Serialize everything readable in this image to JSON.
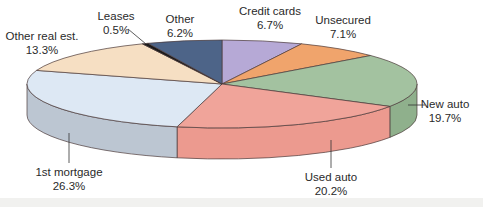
{
  "chart_data": {
    "type": "pie",
    "style": "3d-exploded-none",
    "title": "",
    "start_angle_deg": -90,
    "direction": "clockwise",
    "slices": [
      {
        "label": "Credit cards",
        "value": 6.7,
        "value_label": "6.7%",
        "color": "#b6a9d6",
        "side": "#9a8dbb"
      },
      {
        "label": "Unsecured",
        "value": 7.1,
        "value_label": "7.1%",
        "color": "#f0a46c",
        "side": "#d98a52"
      },
      {
        "label": "New auto",
        "value": 19.7,
        "value_label": "19.7%",
        "color": "#a3c2a0",
        "side": "#8fb08c"
      },
      {
        "label": "Used auto",
        "value": 20.2,
        "value_label": "20.2%",
        "color": "#f0a49a",
        "side": "#ec9a8f"
      },
      {
        "label": "1st mortgage",
        "value": 26.3,
        "value_label": "26.3%",
        "color": "#dde8f4",
        "side": "#bcc6d2"
      },
      {
        "label": "Other real est.",
        "value": 13.3,
        "value_label": "13.3%",
        "color": "#f6dfc3",
        "side": "#e0c8ab"
      },
      {
        "label": "Leases",
        "value": 0.5,
        "value_label": "0.5%",
        "color": "#1a1a1a",
        "side": "#111111"
      },
      {
        "label": "Other",
        "value": 6.2,
        "value_label": "6.2%",
        "color": "#4d6488",
        "side": "#3e5273"
      }
    ],
    "legend": "none (direct labels)"
  },
  "labels": [
    {
      "name": "Credit cards",
      "pct": "6.7%",
      "x": 270,
      "y": 4
    },
    {
      "name": "Unsecured",
      "pct": "7.1%",
      "x": 343,
      "y": 22
    },
    {
      "name": "New auto",
      "pct": "19.7%",
      "x": 446,
      "y": 97
    },
    {
      "name": "Used auto",
      "pct": "20.2%",
      "x": 332,
      "y": 171
    },
    {
      "name": "1st mortgage",
      "pct": "26.3%",
      "x": 69,
      "y": 166
    },
    {
      "name": "Other real est.",
      "pct": "13.3%",
      "x": 42,
      "y": 30
    },
    {
      "name": "Leases",
      "pct": "0.5%",
      "x": 121,
      "y": 10
    },
    {
      "name": "Other",
      "pct": "6.2%",
      "x": 181,
      "y": 14
    }
  ],
  "leaders": [
    {
      "x1": 425,
      "y1": 105,
      "x2": 408,
      "y2": 105
    },
    {
      "x1": 331,
      "y1": 168,
      "x2": 331,
      "y2": 140
    },
    {
      "x1": 69,
      "y1": 163,
      "x2": 69,
      "y2": 133
    },
    {
      "x1": 128,
      "y1": 29,
      "x2": 146,
      "y2": 44
    }
  ]
}
